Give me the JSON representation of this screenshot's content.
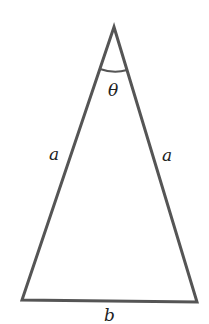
{
  "diagram": {
    "type": "isosceles-triangle",
    "labels": {
      "angle": "θ",
      "left_side": "a",
      "right_side": "a",
      "base": "b"
    },
    "colors": {
      "stroke": "#555555",
      "text": "#222222",
      "background": "#ffffff"
    }
  }
}
